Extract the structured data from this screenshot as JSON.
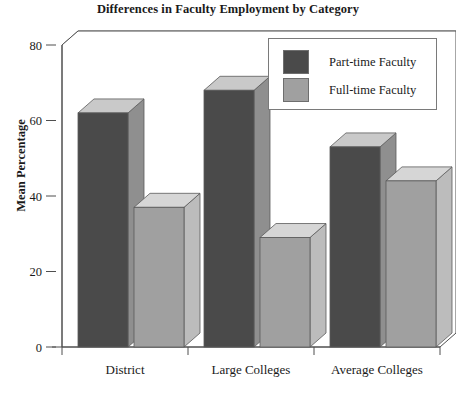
{
  "chart_data": {
    "type": "bar",
    "title": "Differences in Faculty Employment by Category",
    "xlabel": "",
    "ylabel": "Mean Percentage",
    "categories": [
      "District",
      "Large Colleges",
      "Average Colleges"
    ],
    "series": [
      {
        "name": "Part-time Faculty",
        "values": [
          62,
          68,
          53
        ],
        "color": "#4a4a4a"
      },
      {
        "name": "Full-time Faculty",
        "values": [
          37,
          29,
          44
        ],
        "color": "#a0a0a0"
      }
    ],
    "ylim": [
      0,
      80
    ],
    "yticks": [
      0,
      20,
      40,
      60,
      80
    ],
    "ytick_labels": [
      "0",
      "20",
      "40",
      "60",
      "80"
    ],
    "grid": true,
    "legend_position": "top-right",
    "style": "3d-bars"
  },
  "legend": {
    "items": [
      {
        "label": "Part-time Faculty",
        "color": "#4a4a4a"
      },
      {
        "label": "Full-time Faculty",
        "color": "#a0a0a0"
      }
    ]
  },
  "colors": {
    "part_time": "#4a4a4a",
    "part_time_top": "#c9c9c9",
    "part_time_side": "#8f8f8f",
    "full_time": "#a0a0a0",
    "full_time_top": "#d6d6d6",
    "full_time_side": "#bcbcbc",
    "axis": "#4f4f4f",
    "grid": "#8c8c8c",
    "text": "#1a1a1a"
  }
}
